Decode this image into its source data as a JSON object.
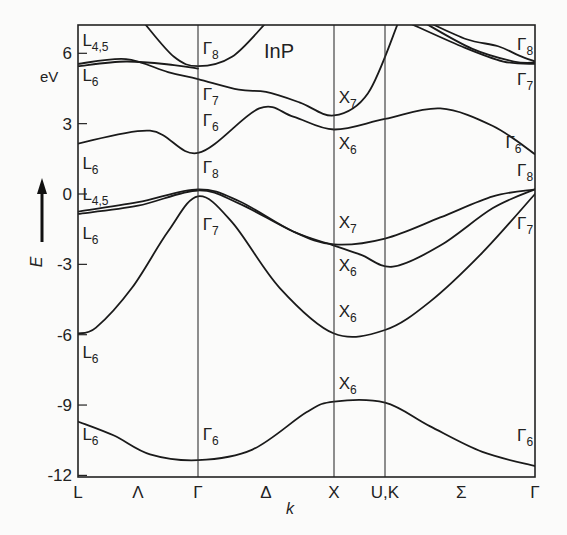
{
  "chart_data": {
    "type": "line",
    "title": "InP",
    "xlabel": "k",
    "ylabel": "E",
    "yunit": "eV",
    "ylim": [
      -12,
      7.3
    ],
    "yticks": [
      6,
      3,
      0,
      -3,
      -6,
      -9,
      -12
    ],
    "ytick_labels": [
      "6",
      "3",
      "0",
      "-3",
      "-6",
      "-9",
      "-12"
    ],
    "k_points": [
      {
        "label": "L",
        "pos": 0
      },
      {
        "label": "Λ",
        "pos": 0.5,
        "direction": true
      },
      {
        "label": "Γ",
        "pos": 1
      },
      {
        "label": "Δ",
        "pos": 1.5,
        "direction": true
      },
      {
        "label": "X",
        "pos": 2
      },
      {
        "label": "U,K",
        "pos": 2.375
      },
      {
        "label": "Σ",
        "pos": 3.1,
        "direction": true
      },
      {
        "label": "Γ",
        "pos": 3.8
      }
    ],
    "series": [
      {
        "name": "band-1 (L6 -> Γ6 -> X6 -> Γ6)",
        "points": [
          [
            0,
            -9.7
          ],
          [
            0.3,
            -10.3
          ],
          [
            0.6,
            -11.1
          ],
          [
            1,
            -11.35
          ],
          [
            1.4,
            -10.9
          ],
          [
            1.8,
            -9.3
          ],
          [
            2,
            -8.85
          ],
          [
            2.375,
            -8.9
          ],
          [
            2.8,
            -9.9
          ],
          [
            3.3,
            -11.0
          ],
          [
            3.8,
            -11.6
          ]
        ]
      },
      {
        "name": "band-2 (L6 -> Γ7 -> X6 -> Γ7)",
        "points": [
          [
            0,
            -5.95
          ],
          [
            0.15,
            -5.7
          ],
          [
            0.45,
            -4.0
          ],
          [
            0.75,
            -1.6
          ],
          [
            1,
            -0.1
          ],
          [
            1.25,
            -1.2
          ],
          [
            1.6,
            -4.0
          ],
          [
            2,
            -5.95
          ],
          [
            2.375,
            -5.8
          ],
          [
            2.8,
            -4.6
          ],
          [
            3.3,
            -2.5
          ],
          [
            3.8,
            0.0
          ]
        ]
      },
      {
        "name": "band-3 (L6 -> Γ8 -> X6 -> Γ8)",
        "points": [
          [
            0,
            -0.85
          ],
          [
            0.5,
            -0.5
          ],
          [
            1,
            0.15
          ],
          [
            1.3,
            -0.4
          ],
          [
            1.7,
            -1.6
          ],
          [
            2,
            -2.2
          ],
          [
            2.2,
            -2.6
          ],
          [
            2.45,
            -3.1
          ],
          [
            2.9,
            -2.2
          ],
          [
            3.4,
            -0.6
          ],
          [
            3.8,
            0.2
          ]
        ]
      },
      {
        "name": "band-4 (L4,5 -> Γ8 -> X7 -> Γ8)",
        "points": [
          [
            0,
            -0.75
          ],
          [
            0.5,
            -0.35
          ],
          [
            1,
            0.2
          ],
          [
            1.3,
            -0.3
          ],
          [
            1.7,
            -1.6
          ],
          [
            2,
            -2.15
          ],
          [
            2.375,
            -1.9
          ],
          [
            2.9,
            -1.0
          ],
          [
            3.4,
            -0.1
          ],
          [
            3.8,
            0.2
          ]
        ]
      },
      {
        "name": "band-5 (L6 -> Γ6 -> X6 -> Γ6)",
        "points": [
          [
            0,
            2.15
          ],
          [
            0.6,
            2.7
          ],
          [
            1,
            1.75
          ],
          [
            1.45,
            3.65
          ],
          [
            1.7,
            3.3
          ],
          [
            2,
            2.75
          ],
          [
            2.375,
            3.2
          ],
          [
            2.9,
            3.65
          ],
          [
            3.4,
            2.9
          ],
          [
            3.8,
            1.7
          ]
        ]
      },
      {
        "name": "band-6 (L6/L4,5 -> Γ7 -> X7)",
        "points": [
          [
            0,
            5.55
          ],
          [
            0.4,
            5.75
          ],
          [
            0.75,
            5.2
          ],
          [
            1,
            4.9
          ],
          [
            1.3,
            4.45
          ],
          [
            1.5,
            4.35
          ],
          [
            1.75,
            3.9
          ],
          [
            2,
            3.35
          ],
          [
            2.25,
            4.3
          ],
          [
            2.5,
            7.3
          ]
        ]
      },
      {
        "name": "band-7 (L4,5 -> Γ8 upper)",
        "points": [
          [
            0,
            5.45
          ],
          [
            0.4,
            5.65
          ],
          [
            0.8,
            5.5
          ],
          [
            1,
            5.35
          ]
        ]
      },
      {
        "name": "band-8 (Γ8 upper parabola)",
        "points": [
          [
            0.55,
            7.3
          ],
          [
            0.8,
            5.85
          ],
          [
            1,
            5.45
          ],
          [
            1.25,
            5.85
          ],
          [
            1.5,
            7.3
          ]
        ]
      },
      {
        "name": "band-9 (Σ upper, → Γ7)",
        "points": [
          [
            2.6,
            7.3
          ],
          [
            3.1,
            6.3
          ],
          [
            3.5,
            5.65
          ],
          [
            3.8,
            5.55
          ]
        ]
      },
      {
        "name": "band-10 (Σ upper, → Γ8)",
        "points": [
          [
            2.75,
            7.3
          ],
          [
            3.2,
            6.2
          ],
          [
            3.6,
            5.65
          ],
          [
            3.8,
            5.6
          ]
        ]
      },
      {
        "name": "band-11 (Σ upper, → Γ8 wavy)",
        "points": [
          [
            2.8,
            7.3
          ],
          [
            3.15,
            6.6
          ],
          [
            3.45,
            6.3
          ],
          [
            3.65,
            5.9
          ],
          [
            3.8,
            5.65
          ]
        ]
      }
    ],
    "labels": [
      {
        "text": "L",
        "sub": "4,5",
        "k": 0.02,
        "E": 6.3
      },
      {
        "text": "L",
        "sub": "6",
        "k": 0.02,
        "E": 4.8
      },
      {
        "text": "L",
        "sub": "6",
        "k": 0.02,
        "E": 1.05
      },
      {
        "text": "L",
        "sub": "4,5",
        "k": 0.02,
        "E": -0.25
      },
      {
        "text": "L",
        "sub": "6",
        "k": 0.02,
        "E": -1.9
      },
      {
        "text": "L",
        "sub": "6",
        "k": 0.02,
        "E": -7.0
      },
      {
        "text": "L",
        "sub": "6",
        "k": 0.02,
        "E": -10.5
      },
      {
        "text": "Γ",
        "sub": "8",
        "k": 1.02,
        "E": 5.95
      },
      {
        "text": "Γ",
        "sub": "7",
        "k": 1.02,
        "E": 4.0
      },
      {
        "text": "Γ",
        "sub": "6",
        "k": 1.02,
        "E": 2.9
      },
      {
        "text": "Γ",
        "sub": "8",
        "k": 1.02,
        "E": 0.9
      },
      {
        "text": "Γ",
        "sub": "7",
        "k": 1.02,
        "E": -1.55
      },
      {
        "text": "Γ",
        "sub": "6",
        "k": 1.02,
        "E": -10.5
      },
      {
        "text": "X",
        "sub": "7",
        "k": 2.02,
        "E": 3.9
      },
      {
        "text": "X",
        "sub": "6",
        "k": 2.02,
        "E": 1.9
      },
      {
        "text": "X",
        "sub": "7",
        "k": 2.02,
        "E": -1.45
      },
      {
        "text": "X",
        "sub": "6",
        "k": 2.02,
        "E": -3.3
      },
      {
        "text": "X",
        "sub": "6",
        "k": 2.02,
        "E": -5.25
      },
      {
        "text": "X",
        "sub": "6",
        "k": 2.02,
        "E": -8.3
      },
      {
        "text": "Γ",
        "sub": "8",
        "k": 3.61,
        "E": 6.15
      },
      {
        "text": "Γ",
        "sub": "7",
        "k": 3.61,
        "E": 4.65
      },
      {
        "text": "Γ",
        "sub": "6",
        "k": 3.5,
        "E": 1.95
      },
      {
        "text": "Γ",
        "sub": "8",
        "k": 3.61,
        "E": 0.75
      },
      {
        "text": "Γ",
        "sub": "7",
        "k": 3.61,
        "E": -1.5
      },
      {
        "text": "Γ",
        "sub": "6",
        "k": 3.61,
        "E": -10.55
      }
    ],
    "grid": false,
    "legend": "none"
  },
  "axis": {
    "unit_label": "eV",
    "e_label": "E",
    "k_label": "k",
    "title": "InP"
  }
}
